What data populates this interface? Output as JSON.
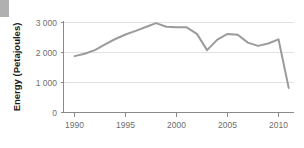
{
  "decoration": {
    "corner_block_color": "#b0b0b0"
  },
  "chart_data": {
    "type": "line",
    "title": "",
    "subtitle": "",
    "xlabel": "",
    "ylabel": "Energy (Petajoules)",
    "x": [
      1990,
      1991,
      1992,
      1993,
      1994,
      1995,
      1996,
      1997,
      1998,
      1999,
      2000,
      2001,
      2002,
      2003,
      2004,
      2005,
      2006,
      2007,
      2008,
      2009,
      2010,
      2011
    ],
    "series": [
      {
        "name": "Energy",
        "color": "#9b9b9b",
        "values": [
          1880,
          1960,
          2080,
          2270,
          2450,
          2600,
          2720,
          2850,
          2980,
          2860,
          2840,
          2840,
          2620,
          2080,
          2430,
          2620,
          2590,
          2330,
          2220,
          2300,
          2440,
          820
        ]
      }
    ],
    "xlim": [
      1990,
      2011
    ],
    "ylim": [
      0,
      3200
    ],
    "xticks": [
      1990,
      1995,
      2000,
      2005,
      2010
    ],
    "xtick_labels": [
      "1990",
      "1995",
      "2000",
      "2005",
      "2010"
    ],
    "yticks": [
      0,
      1000,
      2000,
      3000
    ],
    "ytick_labels": [
      "0",
      "1 000",
      "2 000",
      "3 000"
    ],
    "grid": "horizontal",
    "grid_color": "#e2e2e2",
    "axis_color": "#8a8a8a",
    "legend": false,
    "legend_position": "none"
  }
}
